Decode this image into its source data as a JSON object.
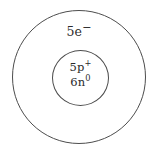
{
  "diagram": {
    "type": "bohr-atomic-model",
    "background_color": "#ffffff",
    "stroke_color": "#4d4d4d",
    "text_color": "#2b2b2b",
    "shells": [
      {
        "name": "electron-shell",
        "label_count": "5",
        "label_particle": "e",
        "label_charge": "−",
        "label_full": "5e⁻"
      }
    ],
    "nucleus": {
      "name": "nucleus",
      "lines": [
        {
          "count": "5",
          "particle": "p",
          "charge": "+",
          "full": "5p⁺"
        },
        {
          "count": "6",
          "particle": "n",
          "charge": "0",
          "full": "6n⁰"
        }
      ]
    }
  }
}
